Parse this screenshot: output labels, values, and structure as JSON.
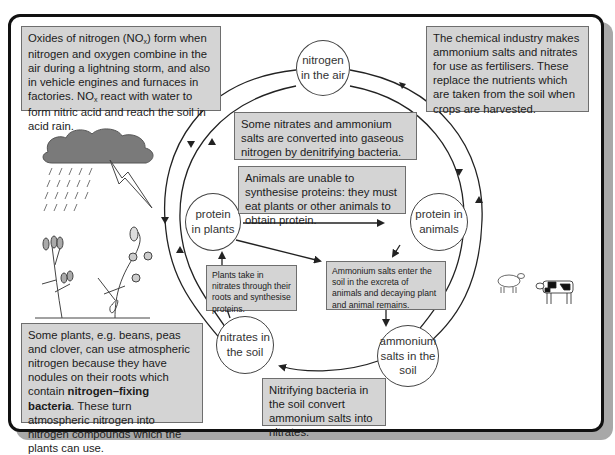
{
  "diagram": {
    "nodes": {
      "nitrogen_air": "nitrogen in the air",
      "protein_plants": "protein in plants",
      "protein_animals": "protein in animals",
      "nitrates_soil": "nitrates in the soil",
      "ammonium_soil": "ammonium salts in the soil"
    },
    "nodes_lines": {
      "nitrogen_air": [
        "nitrogen",
        "in the air"
      ],
      "protein_plants": [
        "protein",
        "in plants"
      ],
      "protein_animals": [
        "protein in",
        "animals"
      ],
      "nitrates_soil": [
        "nitrates in",
        "the soil"
      ],
      "ammonium_soil": [
        "ammonium",
        "salts in the",
        "soil"
      ]
    },
    "boxes": {
      "lightning": {
        "part1": "Oxides of nitrogen (NO",
        "sub1": "x",
        "part2": ") form when nitrogen and oxygen combine in the air during a lightning storm, and also in vehicle engines and furnaces in factories. NO",
        "sub2": "x",
        "part3": " react with water to form nitric acid and reach the soil in acid rain."
      },
      "fertiliser": "The chemical industry makes ammonium salts and nitrates for use as fertilisers. These replace the nutrients which are taken from the soil when crops are harvested.",
      "denitrifying": "Some nitrates and ammonium salts are converted into gaseous nitrogen by denitrifying bacteria.",
      "animals": "Animals are unable to synthesise proteins: they must eat plants or other animals to obtain protein.",
      "plants_take": "Plants take in nitrates through their roots and synthesise proteins.",
      "ammonium_enter": "Ammonium salts enter the soil in the excreta of animals and decaying plant and animal remains.",
      "nitrifying": "Nitrifying bacteria in the soil convert ammonium salts into nitrates.",
      "legumes": {
        "part1": "Some plants, e.g. beans, peas and clover, can use atmospheric nitrogen because they have nodules on their roots which contain ",
        "bold": "nitrogen–fixing bacteria",
        "part2": ". These turn atmospheric nitrogen into  nitrogen compounds which the plants can use."
      }
    },
    "illustrations": [
      "storm-cloud",
      "rain",
      "lightning-bolt",
      "clover-plant",
      "pea-plant",
      "sheep",
      "cow"
    ],
    "colors": {
      "box_fill": "#d4d4d4",
      "box_border": "#6e6e6e",
      "line": "#222222",
      "frame": "#111111",
      "shadow": "#a8a8a8"
    }
  }
}
